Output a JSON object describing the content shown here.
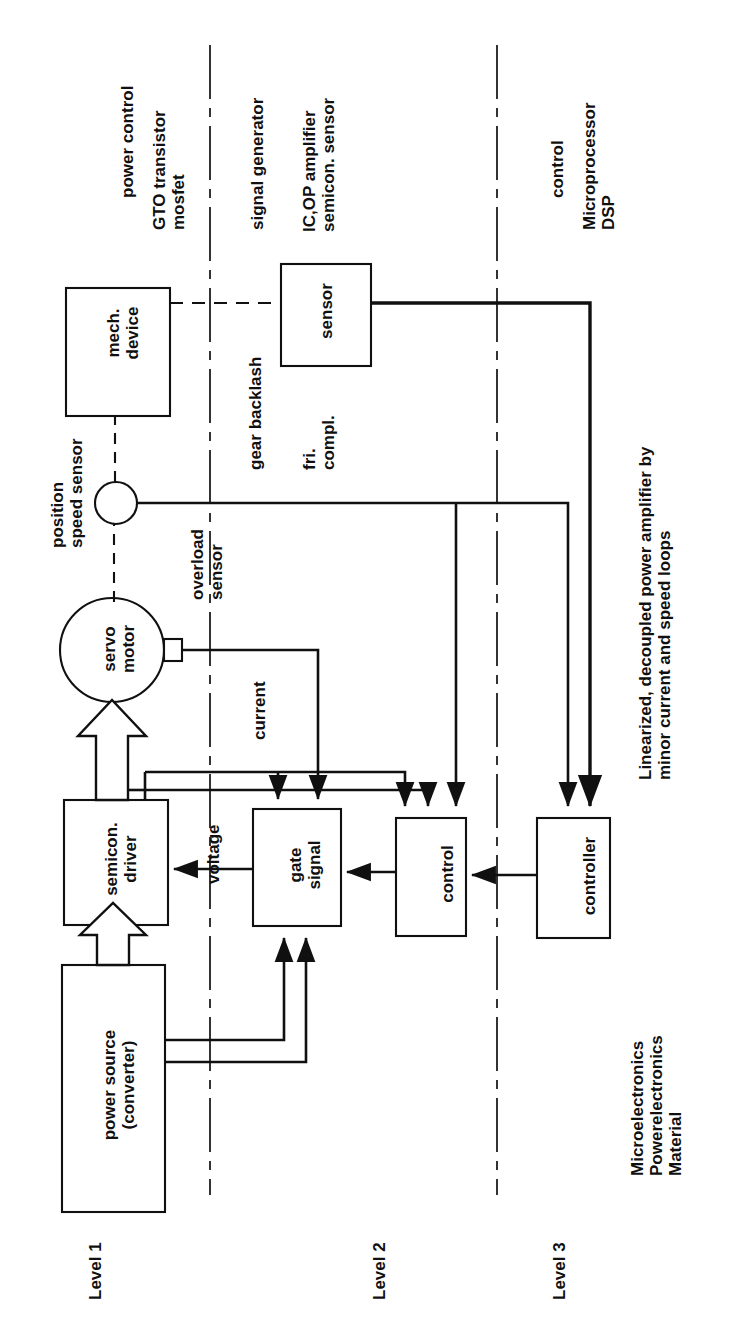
{
  "diagram": {
    "orientation": "rotated-90",
    "caption_main": "Linearized, decoupled power amplifier by\nminor current and speed loops",
    "caption_bottom": "Microelectronics\nPowerelectronics\nMaterial",
    "levels": [
      {
        "id": "level-1",
        "label": "Level 1"
      },
      {
        "id": "level-2",
        "label": "Level 2"
      },
      {
        "id": "level-3",
        "label": "Level 3"
      }
    ],
    "blocks": [
      {
        "id": "mech-device",
        "label": "mech.\ndevice",
        "shape": "rect"
      },
      {
        "id": "sensor",
        "label": "sensor",
        "shape": "rect"
      },
      {
        "id": "speed-sensor",
        "label": "",
        "shape": "circle"
      },
      {
        "id": "servo-motor",
        "label": "servo\nmotor",
        "shape": "circle"
      },
      {
        "id": "semicon-driver",
        "label": "semicon.\ndriver",
        "shape": "rect"
      },
      {
        "id": "gate-signal",
        "label": "gate\nsignal",
        "shape": "rect"
      },
      {
        "id": "control",
        "label": "control",
        "shape": "rect"
      },
      {
        "id": "controller",
        "label": "controller",
        "shape": "rect"
      },
      {
        "id": "power-source",
        "label": "power source\n(converter)",
        "shape": "rect"
      }
    ],
    "technology_labels": [
      {
        "id": "power-control",
        "text": "power control"
      },
      {
        "id": "gto-mosfet",
        "text": "GTO transistor\nmosfet"
      },
      {
        "id": "signal-generator",
        "text": "signal generator"
      },
      {
        "id": "ic-op-amplifier",
        "text": "IC,OP amplifier\nsemicon. sensor"
      },
      {
        "id": "control-tech",
        "text": "control"
      },
      {
        "id": "microprocessor",
        "text": "Microprocessor\nDSP"
      }
    ],
    "signal_labels": [
      {
        "id": "position-speed-sensor",
        "text": "position\nspeed sensor"
      },
      {
        "id": "gear-backlash",
        "text": "gear backlash"
      },
      {
        "id": "fri-compl",
        "text": "fri.\ncompl."
      },
      {
        "id": "overload-sensor",
        "text": "overload\nsensor"
      },
      {
        "id": "current",
        "text": "current"
      },
      {
        "id": "voltage",
        "text": "voltage"
      }
    ],
    "colors": {
      "line": "#101010",
      "text": "#101010",
      "background": "#ffffff"
    }
  }
}
